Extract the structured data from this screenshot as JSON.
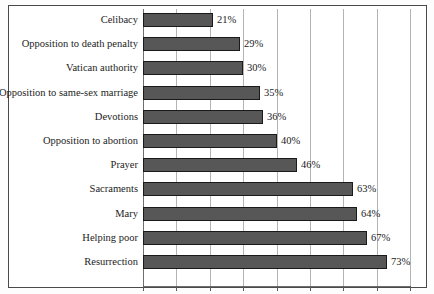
{
  "chart_data": {
    "type": "bar",
    "orientation": "horizontal",
    "title": "",
    "subtitle": "",
    "xlabel": "",
    "ylabel": "",
    "xlim": [
      0,
      80
    ],
    "ylim": null,
    "grid": true,
    "legend": null,
    "legend_position": "none",
    "value_suffix": "%",
    "tick_labels": [],
    "gridline_values": [
      0,
      10,
      20,
      30,
      40,
      50,
      60,
      70,
      80
    ],
    "categories": [
      "Celibacy",
      "Opposition to death penalty",
      "Vatican authority",
      "Opposition to same-sex marriage",
      "Devotions",
      "Opposition to abortion",
      "Prayer",
      "Sacraments",
      "Mary",
      "Helping poor",
      "Resurrection"
    ],
    "values": [
      21,
      29,
      30,
      35,
      36,
      40,
      46,
      63,
      64,
      67,
      73
    ],
    "data_labels": [
      "21%",
      "29%",
      "30%",
      "35%",
      "36%",
      "40%",
      "46%",
      "63%",
      "64%",
      "67%",
      "73%"
    ],
    "colors": {
      "bar_fill": "#575757",
      "bar_outline": "#1a1a1a",
      "gridline": "#b4b4b4",
      "axis": "#6f6f6f",
      "text": "#1c1c1c",
      "frame": "#4a4a4a",
      "background": "#ffffff"
    }
  }
}
